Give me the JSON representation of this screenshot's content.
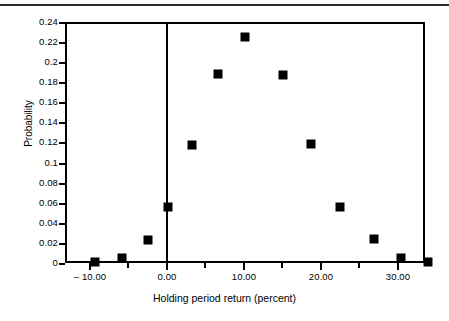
{
  "figure": {
    "background_color": "#ffffff",
    "foreground_color": "#000000",
    "rule_color": "#2b2b2b"
  },
  "chart_data": {
    "type": "scatter",
    "title": "",
    "subtitle": "",
    "xlabel": "Holding period return (percent)",
    "ylabel": "Probability",
    "xlim": [
      -11.5,
      35.5
    ],
    "ylim": [
      0,
      0.24
    ],
    "grid": false,
    "legend": null,
    "marker": "square",
    "marker_color": "#000000",
    "x_tick_labels": [
      "– 10.00",
      "0.00",
      "10.00",
      "20.00",
      "30.00"
    ],
    "x_tick_values": [
      -10,
      0,
      10,
      20,
      30
    ],
    "x_minor_tick_values": [
      -5,
      5,
      15,
      25,
      35
    ],
    "y_tick_labels": [
      "0.24",
      "0.22",
      "0.2",
      "0.18",
      "0.16",
      "0.14",
      "0.12",
      "0.1",
      "0.08",
      "0.06",
      "0.04",
      "0.02",
      "0"
    ],
    "y_tick_values": [
      0.24,
      0.22,
      0.2,
      0.18,
      0.16,
      0.14,
      0.12,
      0.1,
      0.08,
      0.06,
      0.04,
      0.02,
      0
    ],
    "zero_axis_x": 0,
    "x": [
      -9.2,
      -5.7,
      -2.3,
      0.2,
      3.4,
      6.7,
      10.3,
      15.2,
      18.8,
      22.6,
      27.0,
      30.5,
      34.0
    ],
    "y": [
      0.001,
      0.005,
      0.023,
      0.056,
      0.118,
      0.188,
      0.225,
      0.187,
      0.119,
      0.056,
      0.024,
      0.005,
      0.001
    ],
    "points": [
      {
        "x": -9.2,
        "y": 0.001
      },
      {
        "x": -5.7,
        "y": 0.005
      },
      {
        "x": -2.3,
        "y": 0.023
      },
      {
        "x": 0.2,
        "y": 0.056
      },
      {
        "x": 3.4,
        "y": 0.118
      },
      {
        "x": 6.7,
        "y": 0.188
      },
      {
        "x": 10.3,
        "y": 0.225
      },
      {
        "x": 15.2,
        "y": 0.187
      },
      {
        "x": 18.8,
        "y": 0.119
      },
      {
        "x": 22.6,
        "y": 0.056
      },
      {
        "x": 27.0,
        "y": 0.024
      },
      {
        "x": 30.5,
        "y": 0.005
      },
      {
        "x": 34.0,
        "y": 0.001
      }
    ]
  }
}
